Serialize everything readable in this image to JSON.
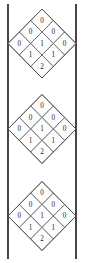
{
  "figure": {
    "background_color": "#ffffff",
    "width": 85,
    "height": 263,
    "rails": {
      "name": "vertical-rails",
      "color": "#1a1a1a",
      "stroke_width": 1.6,
      "left_x": 8,
      "right_x": 76,
      "top_y": 4,
      "bottom_y": 259
    },
    "lattice_style": {
      "edge_color": "#4a4a4a",
      "cell_fill": "#fdfdfd",
      "label_color": "#2b2b2b",
      "label_size": 7.2
    },
    "diamonds": [
      {
        "name": "diamond-1",
        "center_x": 42,
        "center_y": 43.5,
        "half_width": 34,
        "half_height": 34.5,
        "rows": [
          {
            "row_index": 0,
            "values": [
              "0"
            ]
          },
          {
            "row_index": 1,
            "values": [
              "0",
              "0"
            ]
          },
          {
            "row_index": 2,
            "values": [
              "0",
              "1",
              "0"
            ]
          },
          {
            "row_index": 3,
            "values": [
              "1",
              "1"
            ]
          },
          {
            "row_index": 4,
            "values": [
              "2"
            ]
          }
        ]
      },
      {
        "name": "diamond-2",
        "center_x": 42,
        "center_y": 129,
        "half_width": 34,
        "half_height": 34.5,
        "rows": [
          {
            "row_index": 0,
            "values": [
              "0"
            ]
          },
          {
            "row_index": 1,
            "values": [
              "0",
              "0"
            ]
          },
          {
            "row_index": 2,
            "values": [
              "0",
              "1",
              "0"
            ]
          },
          {
            "row_index": 3,
            "values": [
              "1",
              "1"
            ]
          },
          {
            "row_index": 4,
            "values": [
              "2"
            ]
          }
        ]
      },
      {
        "name": "diamond-3",
        "center_x": 42,
        "center_y": 216,
        "half_width": 34,
        "half_height": 34.5,
        "rows": [
          {
            "row_index": 0,
            "values": [
              "0"
            ]
          },
          {
            "row_index": 1,
            "values": [
              "0",
              "0"
            ]
          },
          {
            "row_index": 2,
            "values": [
              "0",
              "1",
              "0"
            ]
          },
          {
            "row_index": 3,
            "values": [
              "1",
              "1"
            ]
          },
          {
            "row_index": 4,
            "values": [
              "2"
            ]
          }
        ]
      }
    ]
  }
}
